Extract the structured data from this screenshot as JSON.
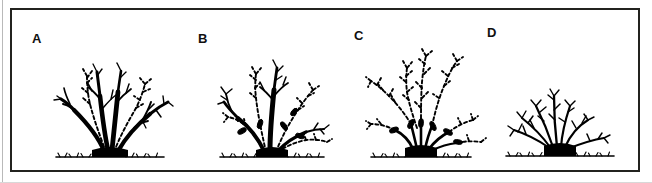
{
  "figure": {
    "kind": "line-drawing",
    "background_color": "#ffffff",
    "ink_color": "#000000",
    "frame_color": "#23231f",
    "panel_count": 4
  },
  "panels": [
    {
      "label": "A",
      "name": "panel-a",
      "caption_key": "A",
      "stage": "unpruned mature shrub",
      "old_wood_style": "solid",
      "new_growth_style": "dashed",
      "cut_marks": 0,
      "label_x": 30,
      "label_y": 34,
      "art_x": 30,
      "art_y": 40,
      "art_w": 150,
      "art_h": 120
    },
    {
      "label": "B",
      "name": "panel-b",
      "caption_key": "B",
      "stage": "one third of oldest canes removed",
      "old_wood_style": "solid",
      "new_growth_style": "dashed",
      "cut_marks": 5,
      "label_x": 196,
      "label_y": 34,
      "art_x": 185,
      "art_y": 40,
      "art_w": 150,
      "art_h": 120
    },
    {
      "label": "C",
      "name": "panel-c",
      "caption_key": "C",
      "stage": "second season, further old canes removed",
      "old_wood_style": "solid",
      "new_growth_style": "dashed",
      "cut_marks": 6,
      "label_x": 352,
      "label_y": 31,
      "art_x": 348,
      "art_y": 40,
      "art_w": 140,
      "art_h": 120
    },
    {
      "label": "D",
      "name": "panel-d",
      "caption_key": "D",
      "stage": "fully renewed shrub of young wood",
      "old_wood_style": "solid",
      "new_growth_style": "none",
      "cut_marks": 0,
      "label_x": 485,
      "label_y": 28,
      "art_x": 480,
      "art_y": 60,
      "art_w": 150,
      "art_h": 100
    }
  ],
  "legend_hints": {
    "solid_line_meaning": "existing / older branches",
    "dashed_line_meaning": "new shoots and young growth",
    "oval_mark_meaning": "pruning cut",
    "black_base_meaning": "crown / stool at soil level",
    "ground_line_meaning": "soil surface with grass tufts"
  }
}
